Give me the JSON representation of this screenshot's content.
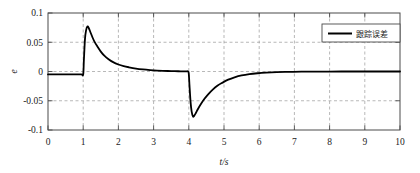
{
  "chart_data": {
    "type": "line",
    "title": "",
    "xlabel": "t/s",
    "ylabel": "e",
    "xlim": [
      0,
      10
    ],
    "ylim": [
      -0.1,
      0.1
    ],
    "xticks": [
      "0",
      "1",
      "2",
      "3",
      "4",
      "5",
      "6",
      "7",
      "8",
      "9",
      "10"
    ],
    "xtick_values": [
      0,
      1,
      2,
      3,
      4,
      5,
      6,
      7,
      8,
      9,
      10
    ],
    "yticks": [
      "0.1",
      "0.05",
      "0",
      "-0.05",
      "-0.1"
    ],
    "ytick_values": [
      0.1,
      0.05,
      0,
      -0.05,
      -0.1
    ],
    "grid": true,
    "grid_style": "dashed",
    "grid_color": "#9a9a9a",
    "legend_position": "top-right",
    "series": [
      {
        "name": "跟踪误差",
        "color": "#000000",
        "linewidth": 1.8,
        "x": [
          0.0,
          0.2,
          0.4,
          0.6,
          0.8,
          0.95,
          1.0,
          1.02,
          1.05,
          1.08,
          1.12,
          1.16,
          1.2,
          1.26,
          1.32,
          1.4,
          1.5,
          1.6,
          1.72,
          1.85,
          2.0,
          2.15,
          2.3,
          2.5,
          2.7,
          2.9,
          3.1,
          3.3,
          3.5,
          3.7,
          3.9,
          3.98,
          4.0,
          4.02,
          4.05,
          4.08,
          4.12,
          4.16,
          4.2,
          4.26,
          4.34,
          4.44,
          4.55,
          4.68,
          4.82,
          4.96,
          5.12,
          5.3,
          5.5,
          5.72,
          5.95,
          6.2,
          6.5,
          6.85,
          7.2,
          7.6,
          8.0,
          8.5,
          9.0,
          9.5,
          10.0
        ],
        "y": [
          -0.005,
          -0.005,
          -0.005,
          -0.005,
          -0.005,
          -0.005,
          -0.005,
          0.02,
          0.055,
          0.07,
          0.077,
          0.074,
          0.068,
          0.059,
          0.051,
          0.043,
          0.034,
          0.027,
          0.021,
          0.016,
          0.012,
          0.0092,
          0.0072,
          0.005,
          0.0035,
          0.0024,
          0.0016,
          0.0011,
          0.0007,
          0.0004,
          0.0002,
          0.0001,
          -0.004,
          -0.024,
          -0.052,
          -0.068,
          -0.077,
          -0.075,
          -0.071,
          -0.064,
          -0.056,
          -0.047,
          -0.039,
          -0.031,
          -0.024,
          -0.019,
          -0.014,
          -0.01,
          -0.0068,
          -0.0045,
          -0.003,
          -0.0019,
          -0.0011,
          -0.0006,
          -0.0003,
          -0.0002,
          -0.0001,
          0.0,
          0.0,
          0.0,
          0.0
        ],
        "peak": {
          "t": 1.12,
          "value": 0.077
        },
        "trough": {
          "t": 4.12,
          "value": -0.077
        }
      }
    ]
  },
  "legend": {
    "entries": [
      {
        "label": "跟踪误差",
        "color": "#000000"
      }
    ]
  },
  "axes": {
    "frame_color": "#4a4a4a",
    "background": "#ffffff"
  }
}
